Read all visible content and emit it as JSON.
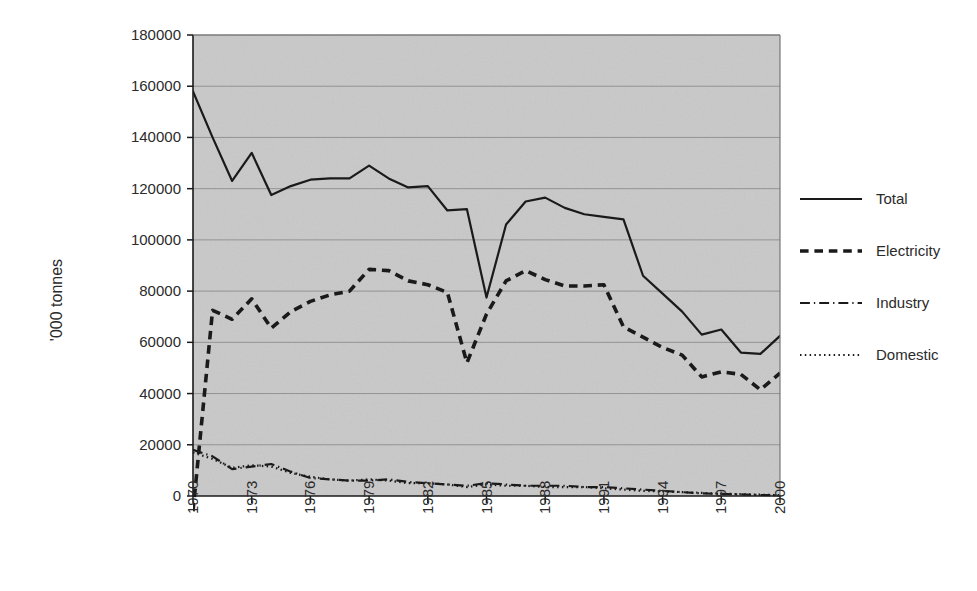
{
  "chart_data": {
    "type": "line",
    "title": "",
    "subtitle": "",
    "xlabel": "",
    "ylabel": "'000 tonnes",
    "xlim": [
      1970,
      2000
    ],
    "ylim": [
      0,
      180000
    ],
    "ytick_step": 20000,
    "xtick_step": 3,
    "grid": true,
    "grid_axis": "y",
    "legend_position": "right",
    "plot_background": "#c9c9c9",
    "line_color": "#1a1a1a",
    "x": [
      1970,
      1971,
      1972,
      1973,
      1974,
      1975,
      1976,
      1977,
      1978,
      1979,
      1980,
      1981,
      1982,
      1983,
      1984,
      1985,
      1986,
      1987,
      1988,
      1989,
      1990,
      1991,
      1992,
      1993,
      1994,
      1995,
      1996,
      1997,
      1998,
      1999,
      2000
    ],
    "ytick_labels": [
      "0",
      "20000",
      "40000",
      "60000",
      "80000",
      "100000",
      "120000",
      "140000",
      "160000",
      "180000"
    ],
    "xtick_labels": [
      "1970",
      "1973",
      "1976",
      "1979",
      "1982",
      "1985",
      "1988",
      "1991",
      "1994",
      "1997",
      "2000"
    ],
    "series": [
      {
        "name": "Total",
        "dash": "solid",
        "width": 2.2,
        "values": [
          158000,
          140000,
          123000,
          134000,
          117500,
          121000,
          123500,
          124000,
          124000,
          129000,
          124000,
          120500,
          121000,
          111500,
          112000,
          77500,
          106000,
          115000,
          116500,
          112500,
          110000,
          109000,
          108000,
          86000,
          79000,
          72000,
          63000,
          65000,
          56000,
          55500,
          62500
        ]
      },
      {
        "name": "Electricity",
        "dash": "dashed",
        "width": 3.6,
        "values": [
          -6000,
          72500,
          69000,
          77000,
          65500,
          72000,
          76000,
          78500,
          80000,
          88500,
          88000,
          84000,
          82500,
          79500,
          52000,
          71000,
          84000,
          88000,
          84500,
          82000,
          82000,
          82500,
          66000,
          62000,
          58000,
          55000,
          46500,
          48500,
          47500,
          41500,
          48000
        ]
      },
      {
        "name": "Industry",
        "dash": "dashdot",
        "width": 2.2,
        "values": [
          18000,
          15500,
          10500,
          11500,
          12500,
          9500,
          7000,
          6500,
          6000,
          6000,
          6500,
          5500,
          5000,
          4500,
          4000,
          5000,
          4500,
          4000,
          4000,
          4000,
          3500,
          3500,
          3000,
          2500,
          2000,
          1500,
          1000,
          800,
          600,
          400,
          300
        ]
      },
      {
        "name": "Domestic",
        "dash": "dotted",
        "width": 2.2,
        "values": [
          17000,
          14500,
          11000,
          12000,
          11500,
          9000,
          7500,
          6500,
          6000,
          6500,
          6000,
          5000,
          5000,
          4500,
          3500,
          4500,
          4000,
          4000,
          3500,
          3500,
          3500,
          3000,
          2500,
          2000,
          1800,
          1500,
          1200,
          900,
          700,
          500,
          300
        ]
      }
    ]
  },
  "axes": {
    "y_axis_title": "'000 tonnes",
    "y_ticks": [
      "180000",
      "160000",
      "140000",
      "120000",
      "100000",
      "80000",
      "60000",
      "40000",
      "20000",
      "0"
    ],
    "x_ticks": [
      "1970",
      "1973",
      "1976",
      "1979",
      "1982",
      "1985",
      "1988",
      "1991",
      "1994",
      "1997",
      "2000"
    ]
  },
  "legend": {
    "items": [
      {
        "label": "Total",
        "style": "solid"
      },
      {
        "label": "Electricity",
        "style": "dashed"
      },
      {
        "label": "Industry",
        "style": "dashdot"
      },
      {
        "label": "Domestic",
        "style": "dotted"
      }
    ]
  }
}
